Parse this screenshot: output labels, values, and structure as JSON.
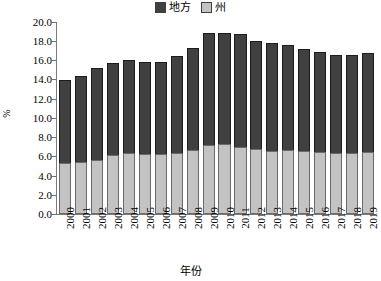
{
  "chart_data": {
    "type": "bar",
    "subtype": "stacked-vertical",
    "title": "",
    "xlabel": "年份",
    "ylabel": "%",
    "ylim": [
      0.0,
      20.0
    ],
    "ytick_step": 2.0,
    "grid": false,
    "legend_position": "top-center",
    "categories": [
      "2000",
      "2001",
      "2002",
      "2003",
      "2004",
      "2005",
      "2006",
      "2007",
      "2008",
      "2009",
      "2010",
      "2011",
      "2012",
      "2013",
      "2014",
      "2015",
      "2016",
      "2017",
      "2018",
      "2019"
    ],
    "series": [
      {
        "name": "州",
        "color": "#c3c3c3",
        "stack_order": "bottom",
        "values": [
          5.3,
          5.4,
          5.6,
          6.1,
          6.4,
          6.3,
          6.2,
          6.4,
          6.7,
          7.2,
          7.3,
          7.0,
          6.8,
          6.6,
          6.7,
          6.6,
          6.5,
          6.4,
          6.4,
          6.5
        ]
      },
      {
        "name": "地方",
        "color": "#404040",
        "stack_order": "top",
        "values": [
          8.7,
          9.0,
          9.6,
          9.6,
          9.6,
          9.5,
          9.6,
          10.1,
          10.6,
          11.7,
          11.6,
          11.8,
          11.2,
          11.2,
          10.9,
          10.6,
          10.4,
          10.2,
          10.2,
          10.3
        ]
      }
    ],
    "totals": [
      14.0,
      14.4,
      15.2,
      15.7,
      16.0,
      15.8,
      15.8,
      16.5,
      17.3,
      18.9,
      18.9,
      18.8,
      18.0,
      17.8,
      17.6,
      17.2,
      16.9,
      16.6,
      16.6,
      16.8
    ],
    "ytick_labels": [
      "20.0",
      "18.0",
      "16.0",
      "14.0",
      "12.0",
      "10.0",
      "8.0",
      "6.0",
      "4.0",
      "2.0",
      "0.0"
    ],
    "ytick_values": [
      20.0,
      18.0,
      16.0,
      14.0,
      12.0,
      10.0,
      8.0,
      6.0,
      4.0,
      2.0,
      0.0
    ]
  },
  "legend": {
    "entries": [
      {
        "label": "地方",
        "color": "#404040"
      },
      {
        "label": "州",
        "color": "#c3c3c3"
      }
    ]
  },
  "axes": {
    "y_title": "%",
    "x_title": "年份"
  }
}
